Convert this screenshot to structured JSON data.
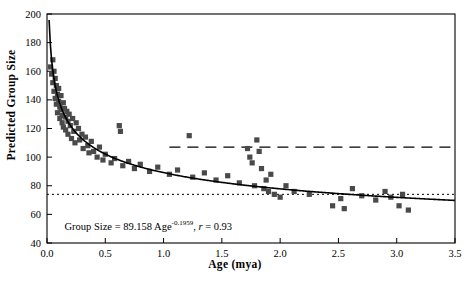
{
  "chart_data": {
    "type": "scatter",
    "title": "",
    "xlabel": "Age (mya)",
    "ylabel": "Predicted  Group Size",
    "xlim": [
      0.0,
      3.5
    ],
    "ylim": [
      40,
      200
    ],
    "xticks": [
      "0.0",
      "0.5",
      "1.0",
      "1.5",
      "2.0",
      "2.5",
      "3.0",
      "3.5"
    ],
    "xtick_values": [
      0.0,
      0.5,
      1.0,
      1.5,
      2.0,
      2.5,
      3.0,
      3.5
    ],
    "yticks": [
      "40",
      "60",
      "80",
      "100",
      "120",
      "140",
      "160",
      "180",
      "200"
    ],
    "ytick_values": [
      40,
      60,
      80,
      100,
      120,
      140,
      160,
      180,
      200
    ],
    "grid": false,
    "legend": "none",
    "annotation": {
      "text": "Group Size = 89.158 Age-0.1959,  r = 0.93",
      "coefficient": "89.158",
      "exponent": "-0.1959",
      "correlation": "0.93",
      "x": 0.15,
      "y": 52
    },
    "reference_lines": [
      {
        "name": "upper-dashed-line",
        "y": 107,
        "style": "dashed",
        "x_start": 1.05,
        "x_end": 3.5
      },
      {
        "name": "lower-dotted-line",
        "y": 74,
        "style": "dotted",
        "x_start": 0.0,
        "x_end": 3.5
      }
    ],
    "fit_curve": {
      "name": "power-fit-curve",
      "formula": "y = 89.158 * x^-0.1959",
      "x": [
        0.02,
        0.05,
        0.08,
        0.12,
        0.18,
        0.25,
        0.35,
        0.5,
        0.7,
        0.9,
        1.2,
        1.5,
        1.8,
        2.1,
        2.4,
        2.7,
        3.0,
        3.3,
        3.5
      ],
      "y": [
        177,
        155,
        143,
        134,
        125,
        119,
        112,
        105,
        99,
        95,
        90,
        86,
        83,
        81,
        79,
        77,
        76,
        75,
        74
      ]
    },
    "series": [
      {
        "name": "primate-species",
        "marker": "square",
        "color": "#4a4a4a",
        "points": [
          [
            0.03,
            163
          ],
          [
            0.04,
            158
          ],
          [
            0.05,
            168
          ],
          [
            0.05,
            152
          ],
          [
            0.06,
            146
          ],
          [
            0.06,
            160
          ],
          [
            0.07,
            141
          ],
          [
            0.07,
            155
          ],
          [
            0.08,
            150
          ],
          [
            0.08,
            137
          ],
          [
            0.09,
            144
          ],
          [
            0.09,
            131
          ],
          [
            0.1,
            148
          ],
          [
            0.1,
            139
          ],
          [
            0.11,
            135
          ],
          [
            0.11,
            127
          ],
          [
            0.12,
            143
          ],
          [
            0.12,
            133
          ],
          [
            0.13,
            129
          ],
          [
            0.13,
            124
          ],
          [
            0.14,
            138
          ],
          [
            0.14,
            121
          ],
          [
            0.15,
            134
          ],
          [
            0.16,
            128
          ],
          [
            0.16,
            119
          ],
          [
            0.17,
            132
          ],
          [
            0.18,
            125
          ],
          [
            0.18,
            116
          ],
          [
            0.19,
            130
          ],
          [
            0.2,
            122
          ],
          [
            0.21,
            113
          ],
          [
            0.22,
            127
          ],
          [
            0.23,
            118
          ],
          [
            0.24,
            110
          ],
          [
            0.25,
            124
          ],
          [
            0.27,
            120
          ],
          [
            0.28,
            112
          ],
          [
            0.3,
            116
          ],
          [
            0.31,
            106
          ],
          [
            0.33,
            114
          ],
          [
            0.35,
            108
          ],
          [
            0.36,
            103
          ],
          [
            0.38,
            111
          ],
          [
            0.4,
            104
          ],
          [
            0.43,
            100
          ],
          [
            0.45,
            107
          ],
          [
            0.48,
            98
          ],
          [
            0.5,
            102
          ],
          [
            0.55,
            96
          ],
          [
            0.58,
            99
          ],
          [
            0.62,
            122
          ],
          [
            0.63,
            118
          ],
          [
            0.65,
            94
          ],
          [
            0.7,
            97
          ],
          [
            0.75,
            92
          ],
          [
            0.8,
            95
          ],
          [
            0.88,
            90
          ],
          [
            0.95,
            93
          ],
          [
            1.05,
            88
          ],
          [
            1.12,
            91
          ],
          [
            1.22,
            115
          ],
          [
            1.25,
            86
          ],
          [
            1.35,
            89
          ],
          [
            1.45,
            84
          ],
          [
            1.55,
            87
          ],
          [
            1.65,
            82
          ],
          [
            1.72,
            106
          ],
          [
            1.74,
            100
          ],
          [
            1.76,
            96
          ],
          [
            1.78,
            80
          ],
          [
            1.8,
            112
          ],
          [
            1.82,
            104
          ],
          [
            1.84,
            92
          ],
          [
            1.86,
            78
          ],
          [
            1.88,
            84
          ],
          [
            1.9,
            76
          ],
          [
            1.92,
            88
          ],
          [
            1.95,
            74
          ],
          [
            2.0,
            72
          ],
          [
            2.05,
            80
          ],
          [
            2.12,
            76
          ],
          [
            2.25,
            74
          ],
          [
            2.45,
            66
          ],
          [
            2.52,
            71
          ],
          [
            2.55,
            64
          ],
          [
            2.62,
            78
          ],
          [
            2.7,
            73
          ],
          [
            2.82,
            70
          ],
          [
            2.9,
            76
          ],
          [
            2.95,
            72
          ],
          [
            3.02,
            66
          ],
          [
            3.05,
            74
          ],
          [
            3.1,
            63
          ]
        ]
      }
    ]
  }
}
